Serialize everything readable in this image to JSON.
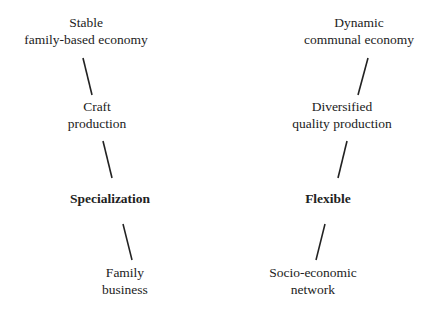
{
  "diagram": {
    "left_chain": {
      "nodes": [
        {
          "lines": [
            "Stable",
            "family-based economy"
          ],
          "bold": false
        },
        {
          "lines": [
            "Craft",
            "production"
          ],
          "bold": false
        },
        {
          "lines": [
            "Specialization"
          ],
          "bold": true
        },
        {
          "lines": [
            "Family",
            "business"
          ],
          "bold": false
        }
      ]
    },
    "right_chain": {
      "nodes": [
        {
          "lines": [
            "Dynamic",
            "communal economy"
          ],
          "bold": false
        },
        {
          "lines": [
            "Diversified",
            "quality production"
          ],
          "bold": false
        },
        {
          "lines": [
            "Flexible"
          ],
          "bold": true
        },
        {
          "lines": [
            "Socio-economic",
            "network"
          ],
          "bold": false
        }
      ]
    },
    "colors": {
      "text": "#222222",
      "line": "#222222",
      "background": "#ffffff"
    }
  }
}
